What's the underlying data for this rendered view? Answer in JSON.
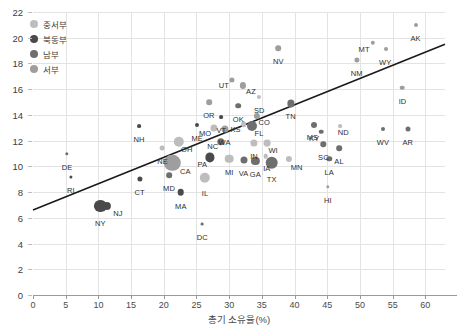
{
  "chart_data": {
    "type": "scatter",
    "title": "",
    "xlabel": "총기 소유율(%)",
    "ylabel": "",
    "xlim": [
      0,
      63
    ],
    "ylim": [
      0,
      22
    ],
    "xticks": [
      0,
      5,
      10,
      15,
      20,
      25,
      30,
      35,
      40,
      45,
      50,
      55,
      60
    ],
    "yticks": [
      0,
      2,
      4,
      6,
      8,
      10,
      12,
      14,
      16,
      18,
      20,
      22
    ],
    "grid": true,
    "legend_position": "top-left",
    "bubble_note": "marker area scales with state population",
    "trendline": {
      "x0": 0,
      "y0": 6.6,
      "x1": 63,
      "y1": 19.5
    },
    "colors": {
      "중서부": "#bdbdbd",
      "북동부": "#4a4a4a",
      "남부": "#6e6e6e",
      "서부": "#9e9e9e",
      "trendline": "#1a1a1a",
      "grid": "#e3e3e3",
      "axis": "#9a9a9a",
      "text": "#3d3d3d"
    },
    "legend": [
      {
        "label": "중서부",
        "color": "#bdbdbd"
      },
      {
        "label": "북동부",
        "color": "#4a4a4a"
      },
      {
        "label": "남부",
        "color": "#6e6e6e"
      },
      {
        "label": "서부",
        "color": "#9e9e9e"
      }
    ],
    "points": [
      {
        "label": "AK",
        "x": 58.5,
        "y": 21.0,
        "r": 2.0,
        "region": "서부",
        "lx": 0,
        "ly": 9
      },
      {
        "label": "MT",
        "x": 52.0,
        "y": 19.6,
        "r": 2.2,
        "region": "서부",
        "lx": -9,
        "ly": 2
      },
      {
        "label": "WY",
        "x": 54.0,
        "y": 19.1,
        "r": 2.0,
        "region": "서부",
        "lx": -1,
        "ly": 9
      },
      {
        "label": "NM",
        "x": 49.5,
        "y": 18.3,
        "r": 2.6,
        "region": "서부",
        "lx": 0,
        "ly": 9
      },
      {
        "label": "NV",
        "x": 37.5,
        "y": 19.2,
        "r": 2.8,
        "region": "서부",
        "lx": 0,
        "ly": 9
      },
      {
        "label": "ID",
        "x": 56.5,
        "y": 16.1,
        "r": 2.3,
        "region": "서부",
        "lx": 0,
        "ly": 9
      },
      {
        "label": "UT",
        "x": 30.4,
        "y": 16.7,
        "r": 2.6,
        "region": "서부",
        "lx": -8,
        "ly": 1
      },
      {
        "label": "AZ",
        "x": 32.1,
        "y": 16.3,
        "r": 3.1,
        "region": "서부",
        "lx": 8,
        "ly": 2
      },
      {
        "label": "SD",
        "x": 34.6,
        "y": 15.4,
        "r": 2.1,
        "region": "중서부",
        "lx": 0,
        "ly": 9
      },
      {
        "label": "OR",
        "x": 26.9,
        "y": 15.0,
        "r": 2.8,
        "region": "서부",
        "lx": 0,
        "ly": 9
      },
      {
        "label": "OK",
        "x": 31.4,
        "y": 14.7,
        "r": 2.8,
        "region": "남부",
        "lx": 0,
        "ly": 9
      },
      {
        "label": "TN",
        "x": 39.4,
        "y": 14.9,
        "r": 3.6,
        "region": "남부",
        "lx": 0,
        "ly": 9
      },
      {
        "label": "CO",
        "x": 34.3,
        "y": 13.9,
        "r": 3.1,
        "region": "서부",
        "lx": 7,
        "ly": 2
      },
      {
        "label": "VT",
        "x": 28.8,
        "y": 13.8,
        "r": 1.9,
        "region": "북동부",
        "lx": 0,
        "ly": 9
      },
      {
        "label": "KS",
        "x": 32.2,
        "y": 13.3,
        "r": 2.8,
        "region": "중서부",
        "lx": -8,
        "ly": 1
      },
      {
        "label": "FL",
        "x": 33.5,
        "y": 13.1,
        "r": 5.0,
        "region": "남부",
        "lx": 7,
        "ly": 3
      },
      {
        "label": "MO",
        "x": 27.7,
        "y": 13.0,
        "r": 3.6,
        "region": "중서부",
        "lx": -9,
        "ly": 1
      },
      {
        "label": "WA",
        "x": 29.3,
        "y": 12.9,
        "r": 3.6,
        "region": "서부",
        "lx": 0,
        "ly": 9
      },
      {
        "label": "ME",
        "x": 25.1,
        "y": 13.2,
        "r": 2.0,
        "region": "북동부",
        "lx": 0,
        "ly": 9
      },
      {
        "label": "KY",
        "x": 43.0,
        "y": 13.2,
        "r": 3.0,
        "region": "남부",
        "lx": 0,
        "ly": 9
      },
      {
        "label": "ND",
        "x": 47.0,
        "y": 13.1,
        "r": 1.9,
        "region": "중서부",
        "lx": 3,
        "ly": 2
      },
      {
        "label": "MS",
        "x": 44.1,
        "y": 12.7,
        "r": 2.3,
        "region": "남부",
        "lx": -9,
        "ly": 1
      },
      {
        "label": "WV",
        "x": 53.5,
        "y": 12.9,
        "r": 2.0,
        "region": "남부",
        "lx": 0,
        "ly": 9
      },
      {
        "label": "AR",
        "x": 57.3,
        "y": 12.9,
        "r": 2.5,
        "region": "남부",
        "lx": 0,
        "ly": 9
      },
      {
        "label": "NH",
        "x": 16.2,
        "y": 13.1,
        "r": 1.9,
        "region": "북동부",
        "lx": 0,
        "ly": 9
      },
      {
        "label": "OH",
        "x": 22.3,
        "y": 11.9,
        "r": 5.2,
        "region": "중서부",
        "lx": 8,
        "ly": 3
      },
      {
        "label": "NC",
        "x": 28.7,
        "y": 11.9,
        "r": 3.7,
        "region": "남부",
        "lx": -8,
        "ly": 0
      },
      {
        "label": "IN",
        "x": 33.8,
        "y": 11.8,
        "r": 3.6,
        "region": "중서부",
        "lx": 0,
        "ly": 9
      },
      {
        "label": "WI",
        "x": 35.8,
        "y": 11.8,
        "r": 3.4,
        "region": "중서부",
        "lx": 6,
        "ly": 3
      },
      {
        "label": "SC",
        "x": 44.4,
        "y": 11.7,
        "r": 2.7,
        "region": "남부",
        "lx": 0,
        "ly": 9
      },
      {
        "label": "AL",
        "x": 46.8,
        "y": 11.4,
        "r": 2.8,
        "region": "남부",
        "lx": 0,
        "ly": 9
      },
      {
        "label": "NE",
        "x": 19.8,
        "y": 11.4,
        "r": 2.4,
        "region": "중서부",
        "lx": 0,
        "ly": 9
      },
      {
        "label": "DE",
        "x": 5.2,
        "y": 11.0,
        "r": 1.7,
        "region": "남부",
        "lx": 0,
        "ly": 9
      },
      {
        "label": "PA",
        "x": 27.1,
        "y": 10.7,
        "r": 4.6,
        "region": "북동부",
        "lx": -8,
        "ly": 3
      },
      {
        "label": "MI",
        "x": 30.0,
        "y": 10.6,
        "r": 4.3,
        "region": "중서부",
        "lx": 0,
        "ly": 9
      },
      {
        "label": "VA",
        "x": 32.2,
        "y": 10.5,
        "r": 3.5,
        "region": "남부",
        "lx": 0,
        "ly": 9
      },
      {
        "label": "GA",
        "x": 34.0,
        "y": 10.4,
        "r": 4.1,
        "region": "남부",
        "lx": 0,
        "ly": 9
      },
      {
        "label": "IA",
        "x": 35.6,
        "y": 10.8,
        "r": 2.3,
        "region": "중서부",
        "lx": 1,
        "ly": 8
      },
      {
        "label": "TX",
        "x": 36.5,
        "y": 10.3,
        "r": 6.3,
        "region": "남부",
        "lx": 0,
        "ly": 12
      },
      {
        "label": "MN",
        "x": 39.1,
        "y": 10.6,
        "r": 3.1,
        "region": "중서부",
        "lx": 8,
        "ly": 4
      },
      {
        "label": "LA",
        "x": 45.3,
        "y": 10.6,
        "r": 2.7,
        "region": "남부",
        "lx": 0,
        "ly": 9
      },
      {
        "label": "CA",
        "x": 21.3,
        "y": 10.3,
        "r": 8.2,
        "region": "서부",
        "lx": 13,
        "ly": 4
      },
      {
        "label": "MD",
        "x": 20.8,
        "y": 9.3,
        "r": 2.8,
        "region": "남부",
        "lx": 0,
        "ly": 9
      },
      {
        "label": "CT",
        "x": 16.3,
        "y": 9.0,
        "r": 2.6,
        "region": "북동부",
        "lx": 0,
        "ly": 9
      },
      {
        "label": "RI",
        "x": 5.8,
        "y": 9.2,
        "r": 1.6,
        "region": "북동부",
        "lx": 0,
        "ly": 9
      },
      {
        "label": "IL",
        "x": 26.3,
        "y": 9.1,
        "r": 5.2,
        "region": "중서부",
        "lx": 0,
        "ly": 11
      },
      {
        "label": "MA",
        "x": 22.6,
        "y": 8.0,
        "r": 3.3,
        "region": "북동부",
        "lx": 0,
        "ly": 10
      },
      {
        "label": "HI",
        "x": 45.1,
        "y": 8.4,
        "r": 1.7,
        "region": "서부",
        "lx": 0,
        "ly": 9
      },
      {
        "label": "NY",
        "x": 10.3,
        "y": 6.9,
        "r": 6.1,
        "region": "북동부",
        "lx": 0,
        "ly": 13
      },
      {
        "label": "NJ",
        "x": 11.3,
        "y": 6.9,
        "r": 4.1,
        "region": "북동부",
        "lx": 11,
        "ly": 3
      },
      {
        "label": "DC",
        "x": 25.9,
        "y": 5.5,
        "r": 1.4,
        "region": "남부",
        "lx": 0,
        "ly": 9
      }
    ]
  }
}
